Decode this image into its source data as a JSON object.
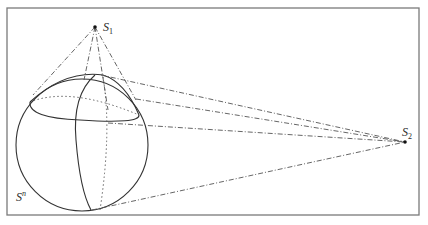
{
  "figure": {
    "frame": {
      "x": 7,
      "y": 8,
      "width": 412,
      "height": 207,
      "stroke": "#777777"
    },
    "sphere": {
      "label": "S",
      "label_sup": "n",
      "center": [
        82,
        145
      ],
      "radius": 66,
      "stroke": "#333333"
    },
    "point_s1": {
      "label": "S",
      "subscript": "1",
      "pos": [
        95,
        27
      ]
    },
    "point_s2": {
      "label": "S",
      "subscript": "2",
      "pos": [
        405,
        142
      ]
    },
    "line_style": "dash-dot",
    "line_color": "#555555"
  }
}
